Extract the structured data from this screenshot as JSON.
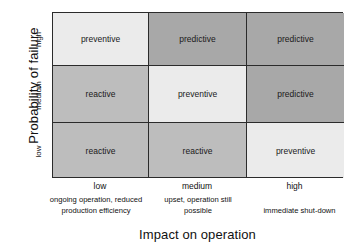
{
  "chart_data": {
    "type": "heatmap",
    "title": "",
    "xlabel": "Impact on operation",
    "ylabel": "Probability of failure",
    "grid": true,
    "legend_position": "none",
    "x_categories": [
      "low",
      "medium",
      "high"
    ],
    "x_sub_captions": [
      "ongoing operation, reduced production efficiency",
      "upset, operation still possible",
      "immediate shut-down"
    ],
    "y_categories": [
      "high",
      "medium",
      "low"
    ],
    "category_colors": {
      "preventive": "#ebebeb",
      "reactive": "#bdbdbd",
      "predictive": "#a8a8a8"
    },
    "rows": [
      {
        "y_label": "high",
        "cells": [
          {
            "value": "preventive",
            "color": "#ebebeb"
          },
          {
            "value": "predictive",
            "color": "#a8a8a8"
          },
          {
            "value": "predictive",
            "color": "#a8a8a8"
          }
        ]
      },
      {
        "y_label": "medium",
        "cells": [
          {
            "value": "reactive",
            "color": "#bdbdbd"
          },
          {
            "value": "preventive",
            "color": "#ebebeb"
          },
          {
            "value": "predictive",
            "color": "#a8a8a8"
          }
        ]
      },
      {
        "y_label": "low",
        "cells": [
          {
            "value": "reactive",
            "color": "#bdbdbd"
          },
          {
            "value": "reactive",
            "color": "#bdbdbd"
          },
          {
            "value": "preventive",
            "color": "#ebebeb"
          }
        ]
      }
    ]
  },
  "axes": {
    "y_title": "Probability of failure",
    "x_title": "Impact on operation",
    "y_ticks": {
      "high": "high",
      "medium": "medium",
      "low": "low"
    },
    "x_ticks": {
      "low": "low",
      "medium": "medium",
      "high": "high"
    },
    "x_sub": {
      "low": "ongoing operation, reduced production efficiency",
      "medium": "upset, operation still possible",
      "high": "immediate shut-down"
    }
  }
}
